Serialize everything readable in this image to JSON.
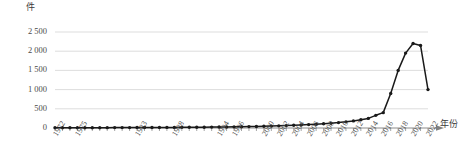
{
  "chart_data": {
    "type": "line",
    "title": "",
    "xlabel": "年份",
    "ylabel": "件",
    "unit_label": "件",
    "xaxis_arrow": true,
    "grid": true,
    "legend": false,
    "marker": "circle",
    "line_color": "#1a1a1a",
    "grid_color": "#d9d9d9",
    "axis_color": "#7f7f7f",
    "text_color": "#404040",
    "ylim": [
      0,
      2500
    ],
    "yticks": [
      0,
      500,
      1000,
      1500,
      2000,
      2500
    ],
    "ytick_labels": [
      "0",
      "500",
      "1 000",
      "1 500",
      "2 000",
      "2 500"
    ],
    "xlim": [
      1972,
      2022
    ],
    "xtick_labels": [
      "1972",
      "1975",
      "1983",
      "1988",
      "1994",
      "1996",
      "2000",
      "2002",
      "2004",
      "2006",
      "2008",
      "2010",
      "2012",
      "2014",
      "2016",
      "2018",
      "2020",
      "2022"
    ],
    "x": [
      1972,
      1973,
      1974,
      1975,
      1976,
      1977,
      1978,
      1979,
      1980,
      1981,
      1982,
      1983,
      1984,
      1985,
      1986,
      1987,
      1988,
      1989,
      1990,
      1991,
      1992,
      1993,
      1994,
      1995,
      1996,
      1997,
      1998,
      1999,
      2000,
      2001,
      2002,
      2003,
      2004,
      2005,
      2006,
      2007,
      2008,
      2009,
      2010,
      2011,
      2012,
      2013,
      2014,
      2015,
      2016,
      2017,
      2018,
      2019,
      2020,
      2021,
      2022
    ],
    "values": [
      5,
      6,
      6,
      7,
      7,
      8,
      8,
      9,
      10,
      10,
      11,
      12,
      12,
      13,
      14,
      15,
      16,
      17,
      18,
      20,
      21,
      23,
      25,
      27,
      30,
      33,
      36,
      40,
      45,
      50,
      56,
      62,
      70,
      78,
      88,
      98,
      110,
      125,
      140,
      160,
      185,
      215,
      250,
      330,
      400,
      900,
      1500,
      1950,
      2200,
      2150,
      1000
    ],
    "series_name": ""
  }
}
